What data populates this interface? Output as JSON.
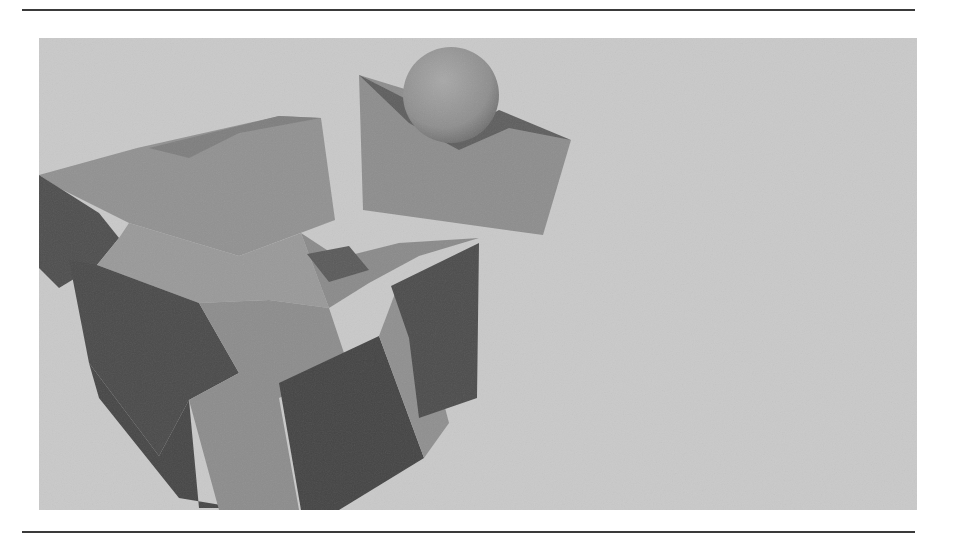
{
  "page": {
    "top_rule": "horizontal-rule",
    "bottom_rule": "horizontal-rule"
  },
  "figure": {
    "colors": {
      "background": "#c9c9c9",
      "light_face": "#919191",
      "mid_face": "#7a7a7a",
      "dark_face": "#4b4b4b",
      "sphere_highlight": "#a6a6a6",
      "sphere_shadow": "#6e6e6e"
    },
    "objects": [
      {
        "type": "cube-cluster",
        "position": "lower-left"
      },
      {
        "type": "wedge",
        "position": "upper-center"
      },
      {
        "type": "sphere",
        "position": "on-wedge"
      }
    ]
  }
}
